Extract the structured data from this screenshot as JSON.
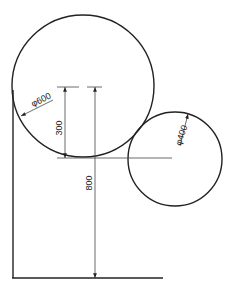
{
  "drawing": {
    "type": "technical-dimension-drawing",
    "large_circle": {
      "label": "φ600",
      "diameter": 600
    },
    "small_circle": {
      "label": "φ400",
      "diameter": 400
    },
    "dimensions": [
      {
        "label": "300",
        "description": "distance from top reference to bottom of large circle"
      },
      {
        "label": "800",
        "description": "height from top reference to base line"
      }
    ]
  }
}
